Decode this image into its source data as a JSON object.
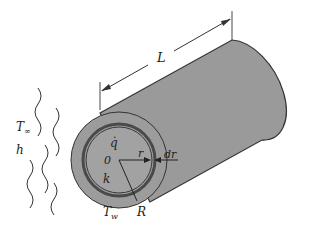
{
  "diagram": {
    "labels": {
      "length": "L",
      "heat_generation": "q̇",
      "origin": "0",
      "radius_variable": "r",
      "shell_thickness": "dr",
      "conductivity": "k",
      "outer_radius": "R",
      "wall_temp_main": "T",
      "wall_temp_sub": "w",
      "ambient_temp_main": "T",
      "ambient_temp_sub": "∞",
      "convection_coefficient": "h"
    },
    "colors": {
      "cylinder_fill": "#9a9a9a",
      "outline": "#333333",
      "ring": "#4a4a4a",
      "background": "#ffffff"
    }
  }
}
